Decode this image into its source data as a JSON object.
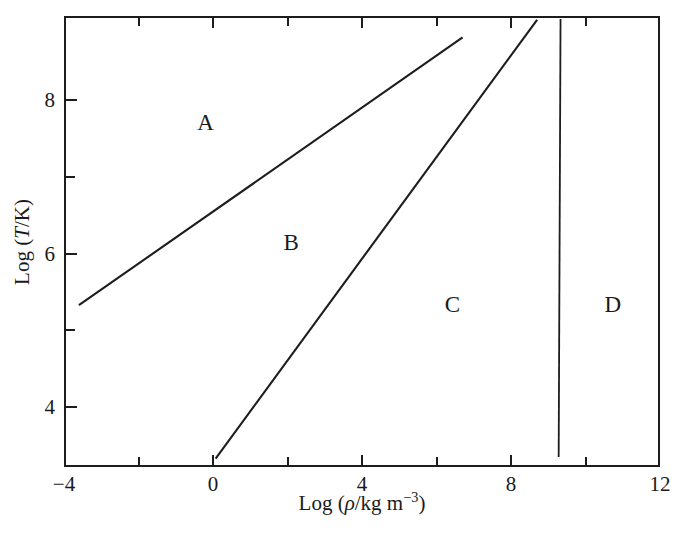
{
  "chart_data": {
    "type": "line",
    "title": "",
    "xlabel": "Log (ρ/kg m−3)",
    "ylabel": "Log (T/K)",
    "xlabel_parts": {
      "prefix": "Log (",
      "symbol": "ρ",
      "mid": "/kg m",
      "exponent": "−3",
      "suffix": ")"
    },
    "ylabel_parts": {
      "prefix": "Log (",
      "symbol": "T",
      "mid": "/K",
      "suffix": ")"
    },
    "xlim": [
      -4,
      12
    ],
    "ylim": [
      3.22,
      9.1
    ],
    "grid": false,
    "legend": null,
    "x_major_ticks": [
      -4,
      0,
      4,
      8,
      12
    ],
    "x_minor_ticks": [
      -2,
      2,
      6,
      10
    ],
    "x_tick_labels": [
      "−4",
      "0",
      "4",
      "8",
      "12"
    ],
    "y_major_ticks": [
      4,
      6,
      8
    ],
    "y_minor_ticks": [
      5,
      7
    ],
    "y_tick_labels": [
      "4",
      "6",
      "8"
    ],
    "tick_direction": "in",
    "series": [
      {
        "name": "A-B boundary",
        "comment": "upper diagonal separating region A from region B",
        "x": [
          -3.6,
          6.7
        ],
        "y": [
          5.33,
          8.82
        ]
      },
      {
        "name": "B-C boundary",
        "comment": "lower diagonal separating region B from region C",
        "x": [
          0.07,
          8.7
        ],
        "y": [
          3.33,
          9.05
        ]
      },
      {
        "name": "C-D boundary",
        "comment": "near-vertical line separating region C from region D",
        "x": [
          9.33,
          9.28
        ],
        "y": [
          9.06,
          3.35
        ]
      }
    ],
    "region_labels": [
      {
        "label": "A",
        "x": -0.2,
        "y": 7.72
      },
      {
        "label": "B",
        "x": 2.1,
        "y": 6.15
      },
      {
        "label": "C",
        "x": 6.43,
        "y": 5.35
      },
      {
        "label": "D",
        "x": 10.73,
        "y": 5.35
      }
    ],
    "line_color": "#1d1d1d",
    "frame_color": "#1d1d1d",
    "background_color": "#ffffff"
  }
}
